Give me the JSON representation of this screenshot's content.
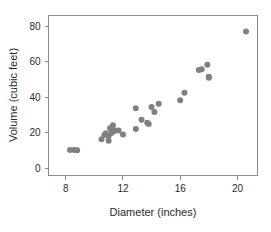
{
  "chart_data": {
    "type": "scatter",
    "title": "",
    "subtitle": "",
    "xlabel": "Diameter (inches)",
    "ylabel": "Volume (cubic feet)",
    "xlim": [
      6.8,
      21.4
    ],
    "ylim": [
      -4,
      86
    ],
    "xticks": [
      8,
      12,
      16,
      20
    ],
    "xtick_labels": [
      "8",
      "12",
      "16",
      "20"
    ],
    "yticks": [
      0,
      20,
      40,
      60,
      80
    ],
    "ytick_labels": [
      "0",
      "20",
      "40",
      "60",
      "80"
    ],
    "grid": false,
    "legend": null,
    "marker": {
      "shape": "circle",
      "color": "#808080",
      "size": 3.0
    },
    "frame_color": "#8a8a8a",
    "series": [
      {
        "name": "Black cherry trees",
        "x": [
          8.3,
          8.6,
          8.8,
          10.5,
          10.7,
          10.8,
          11.0,
          11.0,
          11.1,
          11.2,
          11.3,
          11.4,
          11.4,
          11.7,
          12.0,
          12.9,
          12.9,
          13.3,
          13.7,
          13.8,
          14.0,
          14.2,
          14.5,
          16.0,
          16.3,
          17.3,
          17.5,
          17.9,
          18.0,
          18.0,
          20.6
        ],
        "y": [
          10.3,
          10.3,
          10.2,
          16.4,
          18.8,
          19.7,
          15.6,
          18.2,
          22.6,
          19.9,
          24.2,
          21.0,
          21.4,
          21.3,
          19.1,
          22.2,
          33.8,
          27.4,
          25.7,
          24.9,
          34.5,
          31.7,
          36.3,
          38.3,
          42.6,
          55.4,
          55.7,
          58.3,
          51.5,
          51.0,
          77.0
        ]
      }
    ]
  }
}
